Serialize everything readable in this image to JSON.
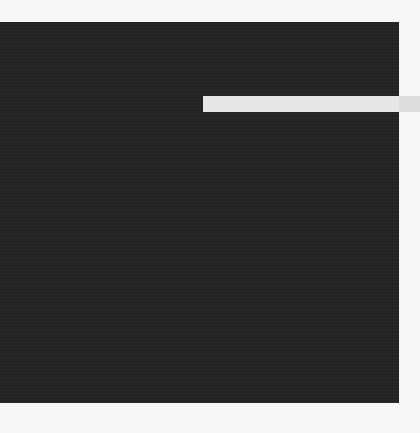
{
  "scene": {
    "description": "Abstract composition: dark textured square with a horizontal light bar extending past its right edge",
    "colors": {
      "background": "#f7f7f7",
      "square": "#242424",
      "bar": "#e6e6e6"
    }
  }
}
